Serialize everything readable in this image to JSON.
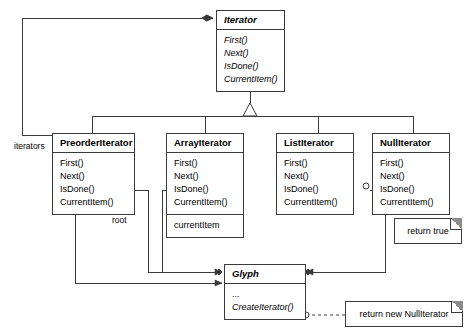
{
  "diagram": {
    "line_color": "#3b3b3b",
    "note_fold_color": "#8c8c8c"
  },
  "classes": {
    "iterator": {
      "name": "Iterator",
      "abstract": true,
      "operations": [
        "First()",
        "Next()",
        "IsDone()",
        "CurrentItem()"
      ]
    },
    "preorder_iterator": {
      "name": "PreorderIterator",
      "abstract": false,
      "operations": [
        "First()",
        "Next()",
        "IsDone()",
        "CurrentItem()"
      ]
    },
    "array_iterator": {
      "name": "ArrayIterator",
      "abstract": false,
      "operations": [
        "First()",
        "Next()",
        "IsDone()",
        "CurrentItem()"
      ],
      "attributes": [
        "currentItem"
      ]
    },
    "list_iterator": {
      "name": "ListIterator",
      "abstract": false,
      "operations": [
        "First()",
        "Next()",
        "IsDone()",
        "CurrentItem()"
      ]
    },
    "null_iterator": {
      "name": "NullIterator",
      "abstract": false,
      "operations": [
        "First()",
        "Next()",
        "IsDone()",
        "CurrentItem()"
      ]
    },
    "glyph": {
      "name": "Glyph",
      "abstract": true,
      "attributes": [
        "..."
      ],
      "operations": [
        "CreateIterator()"
      ]
    }
  },
  "notes": {
    "return_true": "return true",
    "return_new_null_iterator": "return new NullIterator"
  },
  "edge_labels": {
    "iterators": "iterators",
    "root": "root"
  }
}
